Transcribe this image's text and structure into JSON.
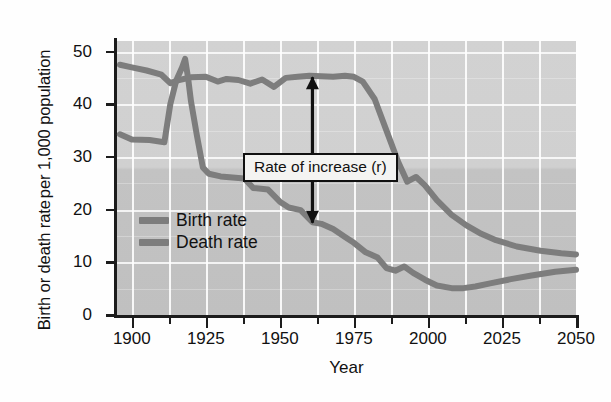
{
  "chart_data": {
    "type": "line",
    "title": "",
    "xlabel": "Year",
    "ylabel_line1": "Birth or death rate",
    "ylabel_line2": "per 1,000 population",
    "xlim": [
      1895,
      2050
    ],
    "ylim": [
      0,
      52
    ],
    "xticks_major": [
      1900,
      1925,
      1950,
      1975,
      2000,
      2025,
      2050
    ],
    "xticks_minor": [
      1912.5,
      1937.5,
      1962.5,
      1987.5,
      2012.5,
      2037.5
    ],
    "xtick_labels": [
      "1900",
      "1925",
      "1950",
      "1975",
      "2000",
      "2025",
      "2050"
    ],
    "yticks": [
      0,
      10,
      20,
      30,
      40,
      50
    ],
    "ytick_labels": [
      "0",
      "10",
      "20",
      "30",
      "40",
      "50"
    ],
    "grid": true,
    "grid_color": "#ffffff",
    "plot_bg_upper": "#d2d2d2",
    "plot_bg_lower": "#c0c0c0",
    "line_color": "#7d7d7d",
    "axis_color": "#1c1c1c",
    "legend_position": "inside-left",
    "series": [
      {
        "name": "Birth rate",
        "color": "#7d7d7d",
        "points": [
          [
            1896,
            47.5
          ],
          [
            1900,
            47.0
          ],
          [
            1905,
            46.4
          ],
          [
            1910,
            45.6
          ],
          [
            1913,
            44.0
          ],
          [
            1916,
            44.6
          ],
          [
            1920,
            45.1
          ],
          [
            1925,
            45.2
          ],
          [
            1929,
            44.3
          ],
          [
            1932,
            44.8
          ],
          [
            1936,
            44.6
          ],
          [
            1940,
            43.9
          ],
          [
            1944,
            44.7
          ],
          [
            1948,
            43.3
          ],
          [
            1952,
            45.0
          ],
          [
            1956,
            45.2
          ],
          [
            1960,
            45.4
          ],
          [
            1964,
            45.3
          ],
          [
            1968,
            45.2
          ],
          [
            1972,
            45.4
          ],
          [
            1975,
            45.2
          ],
          [
            1978,
            44.3
          ],
          [
            1982,
            41.0
          ],
          [
            1986,
            35.0
          ],
          [
            1990,
            29.0
          ],
          [
            1993,
            25.3
          ],
          [
            1996,
            26.2
          ],
          [
            1999,
            24.6
          ],
          [
            2003,
            21.8
          ],
          [
            2008,
            19.0
          ],
          [
            2013,
            17.0
          ],
          [
            2018,
            15.4
          ],
          [
            2023,
            14.2
          ],
          [
            2030,
            13.0
          ],
          [
            2038,
            12.2
          ],
          [
            2045,
            11.7
          ],
          [
            2050,
            11.5
          ]
        ]
      },
      {
        "name": "Death rate",
        "color": "#7d7d7d",
        "points": [
          [
            1896,
            34.3
          ],
          [
            1900,
            33.3
          ],
          [
            1906,
            33.2
          ],
          [
            1911,
            32.8
          ],
          [
            1913,
            40.0
          ],
          [
            1915,
            44.5
          ],
          [
            1917,
            47.0
          ],
          [
            1918,
            48.6
          ],
          [
            1919,
            45.0
          ],
          [
            1920,
            40.5
          ],
          [
            1922,
            34.0
          ],
          [
            1924,
            28.0
          ],
          [
            1926,
            26.8
          ],
          [
            1930,
            26.3
          ],
          [
            1934,
            26.1
          ],
          [
            1938,
            25.9
          ],
          [
            1941,
            24.1
          ],
          [
            1946,
            23.8
          ],
          [
            1950,
            21.5
          ],
          [
            1953,
            20.4
          ],
          [
            1957,
            19.9
          ],
          [
            1961,
            17.6
          ],
          [
            1964,
            17.3
          ],
          [
            1968,
            16.3
          ],
          [
            1972,
            14.8
          ],
          [
            1975,
            13.7
          ],
          [
            1979,
            11.9
          ],
          [
            1983,
            10.9
          ],
          [
            1986,
            8.9
          ],
          [
            1989,
            8.4
          ],
          [
            1992,
            9.2
          ],
          [
            1995,
            8.0
          ],
          [
            1999,
            6.7
          ],
          [
            2003,
            5.6
          ],
          [
            2008,
            5.1
          ],
          [
            2012,
            5.1
          ],
          [
            2016,
            5.4
          ],
          [
            2021,
            6.0
          ],
          [
            2028,
            6.8
          ],
          [
            2035,
            7.5
          ],
          [
            2043,
            8.2
          ],
          [
            2050,
            8.6
          ]
        ]
      }
    ],
    "annotation": {
      "text": "Rate  of increase (r)",
      "arrow_type": "double-headed-vertical",
      "arrow_x_year": 1961,
      "arrow_y_top": 45.3,
      "arrow_y_bottom": 17.3
    },
    "legend": [
      {
        "label": "Birth rate",
        "color": "#7d7d7d"
      },
      {
        "label": "Death rate",
        "color": "#7d7d7d"
      }
    ]
  }
}
